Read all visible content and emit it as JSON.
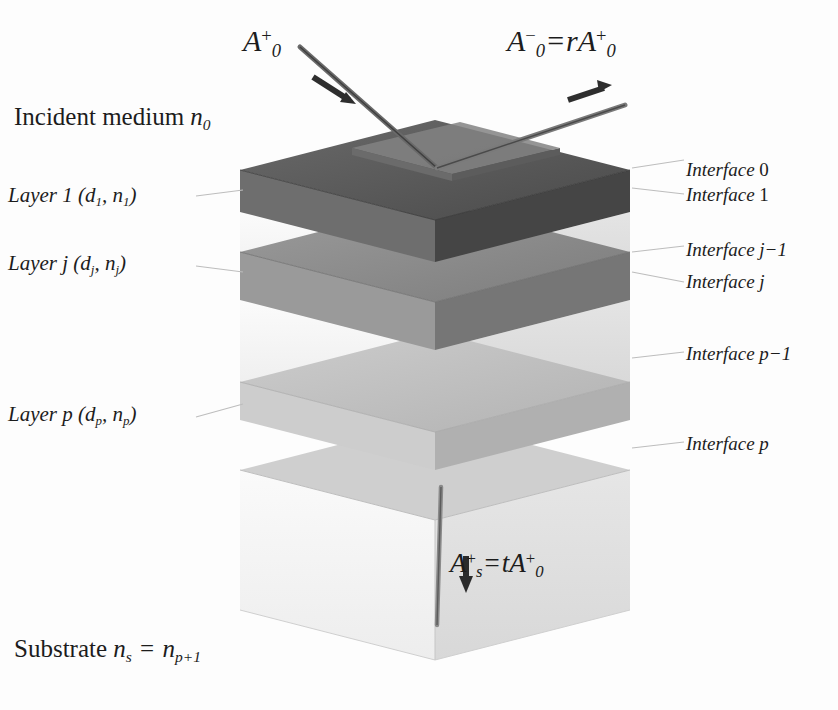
{
  "figure": {
    "background": "#fdfdfd",
    "ink": "#1c1c1c"
  },
  "media": {
    "incident_label_text": "Incident medium",
    "incident_index_symbol": "n",
    "incident_index_sub": "0",
    "substrate_label_text": "Substrate",
    "substrate_symbol": "n",
    "substrate_sub": "s",
    "substrate_equals": "=",
    "substrate_symbol2": "n",
    "substrate_sub2": "p+1"
  },
  "layers": [
    {
      "id": "layer-1",
      "name_text": "Layer",
      "index_text": "1",
      "thickness_symbol": "d",
      "thickness_sub": "1",
      "refractive_symbol": "n",
      "refractive_sub": "1",
      "full_label": "Layer 1 (d1 , n1)",
      "fill": "#4f4f4f"
    },
    {
      "id": "layer-j",
      "name_text": "Layer",
      "index_text": "j",
      "thickness_symbol": "d",
      "thickness_sub": "j",
      "refractive_symbol": "n",
      "refractive_sub": "j",
      "full_label": "Layer j (dj , nj)",
      "fill": "#7a7a7a"
    },
    {
      "id": "layer-p",
      "name_text": "Layer",
      "index_text": "p",
      "thickness_symbol": "d",
      "thickness_sub": "p",
      "refractive_symbol": "n",
      "refractive_sub": "p",
      "full_label": "Layer p (dp , np)",
      "fill": "#b6b6b6"
    }
  ],
  "interfaces": [
    {
      "id": "interface-0",
      "word": "Interface",
      "index": "0",
      "y": 168
    },
    {
      "id": "interface-1",
      "word": "Interface",
      "index": "1",
      "y": 193
    },
    {
      "id": "interface-j-1",
      "word": "Interface",
      "index": "j−1",
      "y": 248
    },
    {
      "id": "interface-j",
      "word": "Interface",
      "index": "j",
      "y": 280
    },
    {
      "id": "interface-p-1",
      "word": "Interface",
      "index": "p−1",
      "y": 352
    },
    {
      "id": "interface-p",
      "word": "Interface",
      "index": "p",
      "y": 442
    }
  ],
  "waves": {
    "incident": {
      "id": "incident-wave",
      "amplitude_symbol": "A",
      "sub": "0",
      "sup": "+",
      "text": "A0+",
      "direction": "down-right"
    },
    "reflected": {
      "id": "reflected-wave",
      "amplitude_symbol": "A",
      "sub": "0",
      "sup": "−",
      "equals": "=",
      "coefficient": "r",
      "rhs_symbol": "A",
      "rhs_sub": "0",
      "rhs_sup": "+",
      "text": "A0− = rA0+",
      "direction": "up-right"
    },
    "transmitted": {
      "id": "transmitted-wave",
      "amplitude_symbol": "A",
      "sub": "s",
      "sup": "+",
      "equals": "=",
      "coefficient": "t",
      "rhs_symbol": "A",
      "rhs_sub": "0",
      "rhs_sup": "+",
      "text": "As+ = tA0+",
      "direction": "down"
    }
  },
  "palette": {
    "slab_dark_top": "#5a5a5a",
    "slab_dark_left": "#6e6e6e",
    "slab_dark_right": "#454545",
    "slab_mid_top": "#8e8e8e",
    "slab_mid_left": "#9a9a9a",
    "slab_mid_right": "#767676",
    "slab_light_top": "#c2c2c2",
    "slab_light_left": "#cfcfcf",
    "slab_light_right": "#b0b0b0",
    "gap_top": "#e9e9e9",
    "gap_left": "#f2f2f2",
    "gap_right": "#dcdcdc",
    "substrate_top": "#cccccc",
    "substrate_left": "#efefef",
    "substrate_right": "#e2e2e2",
    "ray": "#5b5b5b",
    "leader": "#b9b9b9"
  }
}
